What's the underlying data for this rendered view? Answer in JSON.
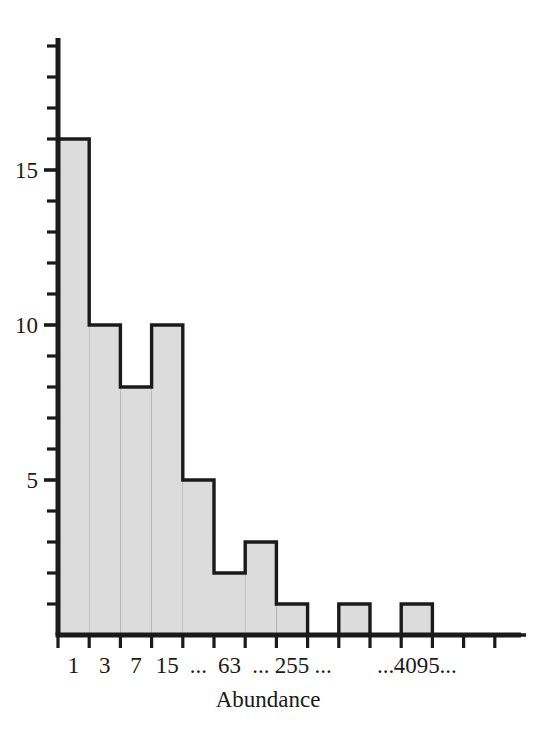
{
  "chart_data": {
    "type": "bar",
    "title": "",
    "subtitle": "",
    "xlabel": "Abundance",
    "ylabel": "",
    "grid": true,
    "legend": null,
    "bar_style": "histogram-stacked-cells",
    "colors": {
      "bar_fill": "#dcdcdc",
      "bar_outline": "#1a1a1a",
      "gridline": "#333333",
      "axis": "#1a1a1a",
      "background": "#ffffff"
    },
    "xlim": [
      0,
      15
    ],
    "ylim": [
      0,
      19
    ],
    "y_tick_step": 1,
    "y_ticks_major": [
      5,
      10,
      15
    ],
    "y_ticks_all": [
      1,
      2,
      3,
      4,
      5,
      6,
      7,
      8,
      9,
      10,
      11,
      12,
      13,
      14,
      15,
      16,
      17,
      18,
      19
    ],
    "y_tick_labels": [
      "5",
      "10",
      "15"
    ],
    "categories": [
      "1",
      "3",
      "7",
      "15",
      "...",
      "63",
      "...",
      "255",
      "...",
      "",
      "...",
      "4095",
      "...",
      "",
      ""
    ],
    "xtick_labels_visible": [
      "1",
      "3",
      "7",
      "15",
      "...",
      "63",
      "...",
      "255",
      "...",
      "...",
      "4095",
      "..."
    ],
    "values": [
      16,
      10,
      8,
      10,
      5,
      2,
      3,
      1,
      0,
      1,
      0,
      1,
      0,
      0,
      0
    ],
    "bins": [
      {
        "label": "1",
        "value": 16
      },
      {
        "label": "3",
        "value": 10
      },
      {
        "label": "7",
        "value": 8
      },
      {
        "label": "15",
        "value": 10
      },
      {
        "label": "...",
        "value": 5
      },
      {
        "label": "63",
        "value": 2
      },
      {
        "label": "...",
        "value": 3
      },
      {
        "label": "255",
        "value": 1
      },
      {
        "label": "...",
        "value": 0
      },
      {
        "label": "",
        "value": 1
      },
      {
        "label": "...",
        "value": 0
      },
      {
        "label": "4095",
        "value": 1
      },
      {
        "label": "...",
        "value": 0
      },
      {
        "label": "",
        "value": 0
      },
      {
        "label": "",
        "value": 0
      }
    ]
  },
  "figure": {
    "axis_title": "Abundance"
  }
}
